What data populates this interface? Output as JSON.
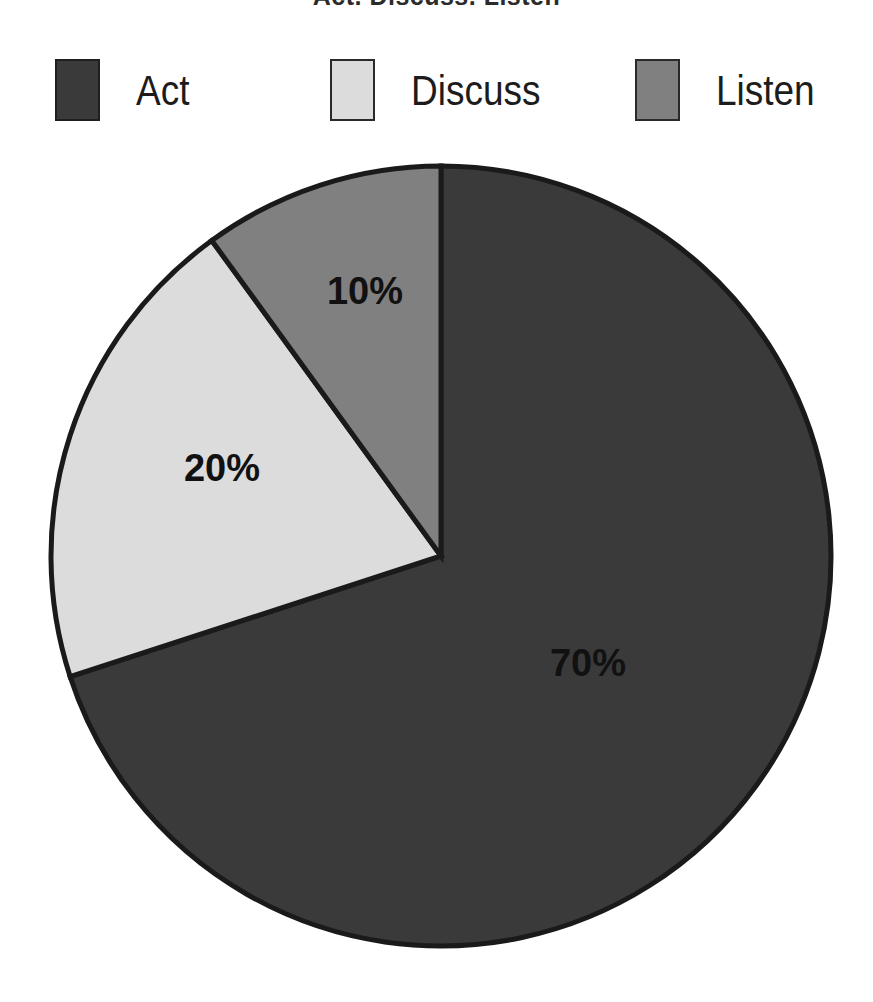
{
  "title": "Act, Discuss, Listen",
  "chart_data": {
    "type": "pie",
    "title": "Act, Discuss, Listen",
    "categories": [
      "Act",
      "Discuss",
      "Listen"
    ],
    "values": [
      70,
      20,
      10
    ],
    "value_labels": [
      "70%",
      "20%",
      "10%"
    ],
    "unit": "percent",
    "total": 100,
    "start_angle_deg": 0,
    "direction": "clockwise",
    "legend_position": "top",
    "grid": false,
    "slices": [
      {
        "label": "Act",
        "value": 70,
        "value_label": "70%",
        "color": "#3a3a3a",
        "sweep_deg": 252,
        "start_deg": 0,
        "end_deg": 252,
        "label_x": 588,
        "label_y": 663
      },
      {
        "label": "Discuss",
        "value": 20,
        "value_label": "20%",
        "color": "#dcdcdc",
        "sweep_deg": 72,
        "start_deg": 252,
        "end_deg": 324,
        "label_x": 222,
        "label_y": 468
      },
      {
        "label": "Listen",
        "value": 10,
        "value_label": "10%",
        "color": "#808080",
        "sweep_deg": 36,
        "start_deg": 324,
        "end_deg": 360,
        "label_x": 365,
        "label_y": 291
      }
    ],
    "geometry": {
      "center_x": 441,
      "center_y": 556,
      "radius": 390
    },
    "outline_color": "#1a1a1a"
  },
  "legend": {
    "items": [
      {
        "label": "Act",
        "color": "#3a3a3a"
      },
      {
        "label": "Discuss",
        "color": "#dcdcdc"
      },
      {
        "label": "Listen",
        "color": "#808080"
      }
    ]
  }
}
